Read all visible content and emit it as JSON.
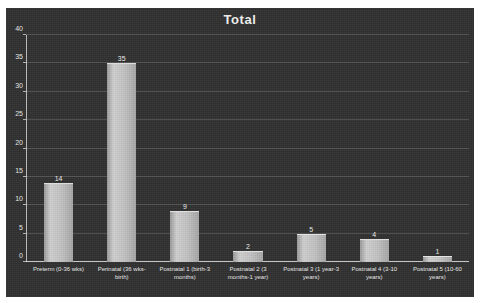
{
  "chart_data": {
    "type": "bar",
    "title": "Total",
    "xlabel": "",
    "ylabel": "",
    "ylim": [
      0,
      40
    ],
    "yticks": [
      0,
      5,
      10,
      15,
      20,
      25,
      30,
      35,
      40
    ],
    "grid": true,
    "legend": "none",
    "categories": [
      "Preterm (0-36 wks)",
      "Perinatal (36 wks-birth)",
      "Postnatal 1 (birth-3 months)",
      "Postnatal 2 (3 months-1 year)",
      "Postnatal 3 (1 year-3 years)",
      "Postnatal 4 (3-10 years)",
      "Postnatal 5 (10-60 years)"
    ],
    "values": [
      14,
      35,
      9,
      2,
      5,
      4,
      1
    ],
    "data_labels": [
      "14",
      "35",
      "9",
      "2",
      "5",
      "4",
      "1"
    ],
    "colors": {
      "background": "#2f2f2f",
      "bar": "#c2c2c2",
      "text": "#ededed",
      "gridline": "#6a6a6a"
    }
  }
}
